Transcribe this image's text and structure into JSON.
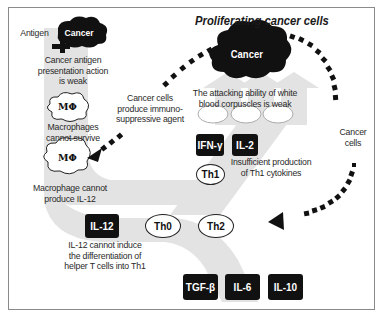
{
  "diagram": {
    "title": "Proliferating cancer cells",
    "colors": {
      "pathway_gray": "#e3e3e3",
      "box_fill": "#111111",
      "text": "#2a2a2a",
      "frame_border": "#8a8a8a"
    },
    "cancer_main": {
      "label": "Cancer"
    },
    "cancer_small": {
      "label": "Cancer"
    },
    "antigen_label": "Antigen",
    "annotations": {
      "antigen_presentation": [
        "Cancer antigen",
        "presentation action",
        "is weak"
      ],
      "macrophages_survive": [
        "Macrophages",
        "cannot survive"
      ],
      "macrophage_il12": [
        "Macrophage cannot",
        "produce IL-12"
      ],
      "immunosuppressive": [
        "Cancer cells",
        "produce immuno-",
        "suppressive agent"
      ],
      "attacking_ability": [
        "The attacking ability of white",
        "blood corpuscles is weak"
      ],
      "th1_cytokines": [
        "Insufficient production",
        "of Th1 cytokines"
      ],
      "cancer_cells_arrow": [
        "Cancer",
        "cells"
      ],
      "il12_induce": [
        "IL-12 cannot induce",
        "the differentiation of",
        "helper T cells into Th1"
      ]
    },
    "macrophages": [
      {
        "label": "MΦ"
      },
      {
        "label": "MΦ"
      }
    ],
    "cytokine_boxes": {
      "ifn_gamma": "IFN-γ",
      "il2": "IL-2",
      "il12": "IL-12",
      "tgf_beta": "TGF-β",
      "il6": "IL-6",
      "il10": "IL-10"
    },
    "t_cells": {
      "th1": "Th1",
      "th0": "Th0",
      "th2": "Th2"
    }
  }
}
